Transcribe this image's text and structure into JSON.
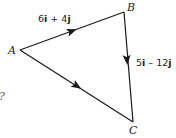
{
  "diagram": {
    "type": "vector-triangle",
    "points": {
      "A": {
        "label": "A",
        "x": 20,
        "y": 50
      },
      "B": {
        "label": "B",
        "x": 124,
        "y": 12
      },
      "C": {
        "label": "C",
        "x": 133,
        "y": 122
      }
    },
    "edges": [
      {
        "from": "A",
        "to": "B",
        "vector": {
          "i": "6",
          "op": "+",
          "j": "4"
        },
        "text": "6i + 4j"
      },
      {
        "from": "B",
        "to": "C",
        "vector": {
          "i": "5",
          "op": "–",
          "j": "12"
        },
        "text": "5i – 12j"
      },
      {
        "from": "A",
        "to": "C",
        "vector": null,
        "text": ""
      }
    ],
    "partial_text": "?",
    "line_color": "#1a1a1a"
  }
}
